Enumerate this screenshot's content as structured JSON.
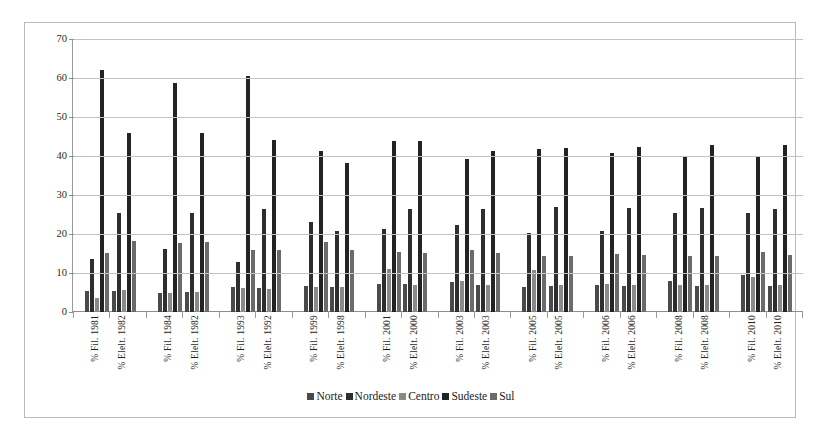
{
  "chart_data": {
    "type": "bar",
    "title": "",
    "xlabel": "",
    "ylabel": "",
    "ylim": [
      0,
      70
    ],
    "yticks": [
      0,
      10,
      20,
      30,
      40,
      50,
      60,
      70
    ],
    "grid": true,
    "legend_position": "bottom",
    "categories": [
      "% Fil. 1981",
      "% Elelt. 1982",
      "% Fil. 1984",
      "% Elelt. 1982",
      "% Fil. 1993",
      "% Elelt. 1992",
      "% Fil. 1999",
      "% Elelt. 1998",
      "% Fil. 2001",
      "% Elelt. 2000",
      "% Fil. 2003",
      "% Elelt. 2003",
      "% Fil. 2005",
      "% Elelt. 2005",
      "% Fil. 2006",
      "% Elelt. 2006",
      "% Fil. 2008",
      "% Elelt. 2008",
      "% Fil. 2010",
      "% Elelt. 2010"
    ],
    "series": [
      {
        "name": "Norte",
        "color": "#4a4a4a",
        "values": [
          5.3,
          5.5,
          5.0,
          5.1,
          6.5,
          6.2,
          6.6,
          6.5,
          7.3,
          7.2,
          7.7,
          6.8,
          6.3,
          6.6,
          6.9,
          6.7,
          8.0,
          6.7,
          9.4,
          6.6
        ]
      },
      {
        "name": "Nordeste",
        "color": "#2e2e2e",
        "values": [
          13.7,
          25.5,
          16.2,
          25.5,
          12.8,
          26.5,
          23.2,
          20.8,
          21.2,
          26.5,
          22.2,
          26.5,
          20.3,
          26.8,
          20.8,
          26.6,
          25.5,
          26.7,
          25.3,
          26.5
        ]
      },
      {
        "name": "Centro",
        "color": "#8a8a8a",
        "values": [
          3.6,
          5.6,
          5.0,
          5.1,
          6.2,
          6.0,
          6.5,
          6.4,
          11.0,
          7.0,
          8.0,
          7.0,
          10.8,
          7.0,
          7.2,
          6.9,
          7.0,
          6.9,
          9.0,
          6.8
        ]
      },
      {
        "name": "Sudeste",
        "color": "#232323",
        "values": [
          62.0,
          46.0,
          58.6,
          45.8,
          60.6,
          44.2,
          41.4,
          38.3,
          43.8,
          43.8,
          39.2,
          41.2,
          41.8,
          42.0,
          40.8,
          42.2,
          39.8,
          42.8,
          39.8,
          42.8
        ]
      },
      {
        "name": "Sul",
        "color": "#6b6b6b",
        "values": [
          15.2,
          18.1,
          17.6,
          18.0,
          16.0,
          16.0,
          18.0,
          15.8,
          15.3,
          15.2,
          15.8,
          15.2,
          14.3,
          14.3,
          14.8,
          14.5,
          14.4,
          14.3,
          15.4,
          14.6
        ]
      }
    ]
  },
  "legend": {
    "items": [
      {
        "label": "Norte",
        "color": "#4a4a4a"
      },
      {
        "label": "Nordeste",
        "color": "#2e2e2e"
      },
      {
        "label": "Centro",
        "color": "#8a8a8a"
      },
      {
        "label": "Sudeste",
        "color": "#232323"
      },
      {
        "label": "Sul",
        "color": "#6b6b6b"
      }
    ]
  }
}
